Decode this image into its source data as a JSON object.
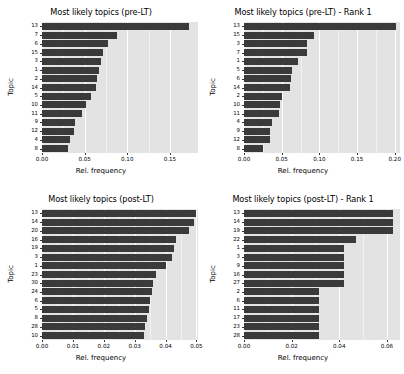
{
  "figure": {
    "panel_bg": "#e3e3e3",
    "bar_color": "#3a3a3a",
    "grid_color": "#ffffff"
  },
  "chart_data": [
    {
      "type": "bar",
      "orientation": "horizontal",
      "title": "Most likely topics (pre-LT)",
      "xlabel": "Rel. frequency",
      "ylabel": "Topic",
      "xlim": [
        0,
        0.183
      ],
      "xticks": [
        "0.00",
        "0.05",
        "0.10",
        "0.15"
      ],
      "xtick_values": [
        0.0,
        0.05,
        0.1,
        0.15
      ],
      "grid": true,
      "legend": "none",
      "categories": [
        "13",
        "7",
        "6",
        "15",
        "3",
        "1",
        "2",
        "14",
        "5",
        "10",
        "11",
        "9",
        "12",
        "4",
        "8"
      ],
      "values": [
        0.173,
        0.088,
        0.077,
        0.072,
        0.069,
        0.067,
        0.065,
        0.063,
        0.058,
        0.052,
        0.047,
        0.039,
        0.037,
        0.033,
        0.03
      ]
    },
    {
      "type": "bar",
      "orientation": "horizontal",
      "title": "Most likely topics (pre-LT) - Rank 1",
      "xlabel": "Rel. frequency",
      "ylabel": "Topic",
      "xlim": [
        0,
        0.207
      ],
      "xticks": [
        "0.00",
        "0.05",
        "0.10",
        "0.15",
        "0.20"
      ],
      "xtick_values": [
        0.0,
        0.05,
        0.1,
        0.15,
        0.2
      ],
      "grid": true,
      "legend": "none",
      "categories": [
        "13",
        "15",
        "3",
        "7",
        "1",
        "5",
        "6",
        "14",
        "2",
        "10",
        "11",
        "4",
        "9",
        "12",
        "8"
      ],
      "values": [
        0.202,
        0.093,
        0.084,
        0.083,
        0.072,
        0.064,
        0.063,
        0.061,
        0.05,
        0.048,
        0.047,
        0.037,
        0.035,
        0.034,
        0.025
      ]
    },
    {
      "type": "bar",
      "orientation": "horizontal",
      "title": "Most likely topics (post-LT)",
      "xlabel": "Rel. frequency",
      "ylabel": "Topic",
      "xlim": [
        0,
        0.0505
      ],
      "xticks": [
        "0.00",
        "0.01",
        "0.02",
        "0.03",
        "0.04",
        "0.05"
      ],
      "xtick_values": [
        0.0,
        0.01,
        0.02,
        0.03,
        0.04,
        0.05
      ],
      "grid": true,
      "legend": "none",
      "categories": [
        "13",
        "14",
        "20",
        "16",
        "19",
        "3",
        "1",
        "23",
        "30",
        "24",
        "6",
        "5",
        "8",
        "28",
        "10"
      ],
      "values": [
        0.0497,
        0.0492,
        0.0477,
        0.0435,
        0.0428,
        0.042,
        0.04,
        0.0368,
        0.036,
        0.0355,
        0.035,
        0.0345,
        0.034,
        0.0333,
        0.033
      ]
    },
    {
      "type": "bar",
      "orientation": "horizontal",
      "title": "Most likely topics (post-LT) - Rank 1",
      "xlabel": "Rel. frequency",
      "ylabel": "Topic",
      "xlim": [
        0,
        0.0655
      ],
      "xticks": [
        "0.00",
        "0.02",
        "0.04",
        "0.06"
      ],
      "xtick_values": [
        0.0,
        0.02,
        0.04,
        0.06
      ],
      "grid": true,
      "legend": "none",
      "categories": [
        "13",
        "14",
        "19",
        "22",
        "1",
        "3",
        "9",
        "16",
        "27",
        "2",
        "6",
        "11",
        "17",
        "23",
        "28"
      ],
      "values": [
        0.0625,
        0.0625,
        0.0625,
        0.0472,
        0.042,
        0.042,
        0.042,
        0.042,
        0.042,
        0.0315,
        0.0315,
        0.0315,
        0.0315,
        0.0315,
        0.0315
      ]
    }
  ]
}
